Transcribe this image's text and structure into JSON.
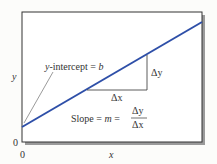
{
  "diagram": {
    "y_axis_label": "y",
    "x_axis_label": "x",
    "y_origin_label": "0",
    "x_origin_label": "0",
    "intercept_label_var": "y",
    "intercept_label_rest": "-intercept = ",
    "intercept_label_b": "b",
    "delta_y": "Δy",
    "delta_x": "Δx",
    "slope_text": "Slope = ",
    "slope_m": "m",
    "slope_eq": " = ",
    "frac_num": "Δy",
    "frac_den": "Δx",
    "line_color": "#2e4fa8"
  }
}
